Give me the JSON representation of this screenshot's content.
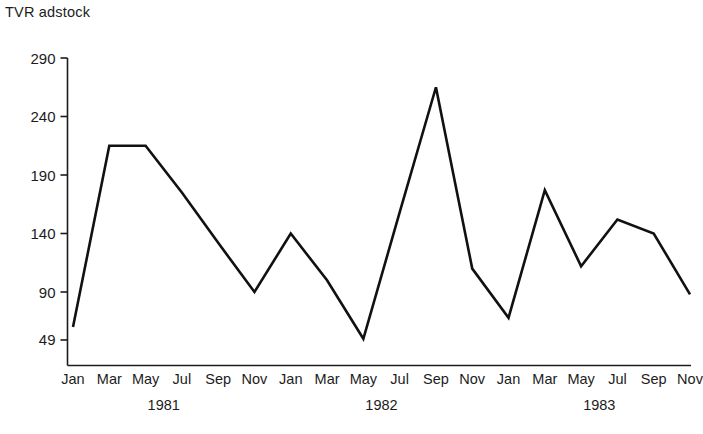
{
  "chart_data": {
    "type": "line",
    "title": "TVR adstock",
    "xlabel": "",
    "ylabel": "",
    "ylim": [
      49,
      290
    ],
    "yticks": [
      49,
      90,
      140,
      190,
      240,
      290
    ],
    "grid": false,
    "legend": "none",
    "categories": [
      "Jan 1981",
      "Mar 1981",
      "May 1981",
      "Jul 1981",
      "Sep 1981",
      "Nov 1981",
      "Jan 1982",
      "Mar 1982",
      "May 1982",
      "Jul 1982",
      "Sep 1982",
      "Nov 1982",
      "Jan 1983",
      "Mar 1983",
      "May 1983",
      "Jul 1983",
      "Sep 1983",
      "Nov 1983"
    ],
    "xtick_labels": [
      "Jan",
      "Mar",
      "May",
      "Jul",
      "Sep",
      "Nov",
      "Jan",
      "Mar",
      "May",
      "Jul",
      "Sep",
      "Nov",
      "Jan",
      "Mar",
      "May",
      "Jul",
      "Sep",
      "Nov"
    ],
    "year_groups": [
      {
        "label": "1981",
        "start_index": 0,
        "end_index": 5
      },
      {
        "label": "1982",
        "start_index": 6,
        "end_index": 11
      },
      {
        "label": "1983",
        "start_index": 12,
        "end_index": 17
      }
    ],
    "values": [
      60,
      215,
      215,
      175,
      132,
      90,
      140,
      100,
      50,
      158,
      265,
      110,
      68,
      177,
      112,
      152,
      140,
      88
    ],
    "series": [
      {
        "name": "TVR adstock",
        "color": "#111111",
        "values": [
          60,
          215,
          215,
          175,
          132,
          90,
          140,
          100,
          50,
          158,
          265,
          110,
          68,
          177,
          112,
          152,
          140,
          88
        ]
      }
    ]
  }
}
